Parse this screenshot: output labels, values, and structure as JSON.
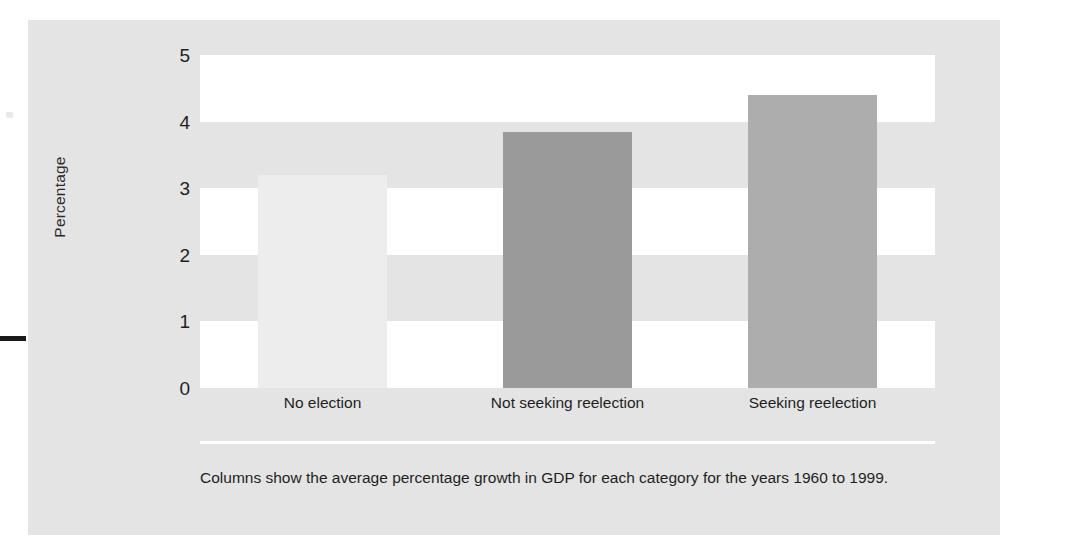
{
  "chart_data": {
    "type": "bar",
    "title": "",
    "subtitle": "",
    "xlabel": "",
    "ylabel": "Percentage",
    "categories": [
      "No election",
      "Not seeking reelection",
      "Seeking reelection"
    ],
    "values": [
      3.2,
      3.85,
      4.4
    ],
    "bar_colors": [
      "#ededed",
      "#9a9a9a",
      "#adadad"
    ],
    "ylim": [
      0,
      5
    ],
    "y_ticks": [
      "0",
      "1",
      "2",
      "3",
      "4",
      "5"
    ],
    "y_tick_values": [
      0,
      1,
      2,
      3,
      4,
      5
    ],
    "grid": "alternating-horizontal-bands",
    "band_colors": {
      "light": "#ffffff",
      "dark": "#e4e4e4"
    },
    "legend": "none",
    "annotations": []
  },
  "figure": {
    "panel_color": "#e4e4e4",
    "axis_rule_color": "#ffffff",
    "caption": "Columns show the average percentage growth in GDP for each category for the years 1960 to 1999."
  }
}
